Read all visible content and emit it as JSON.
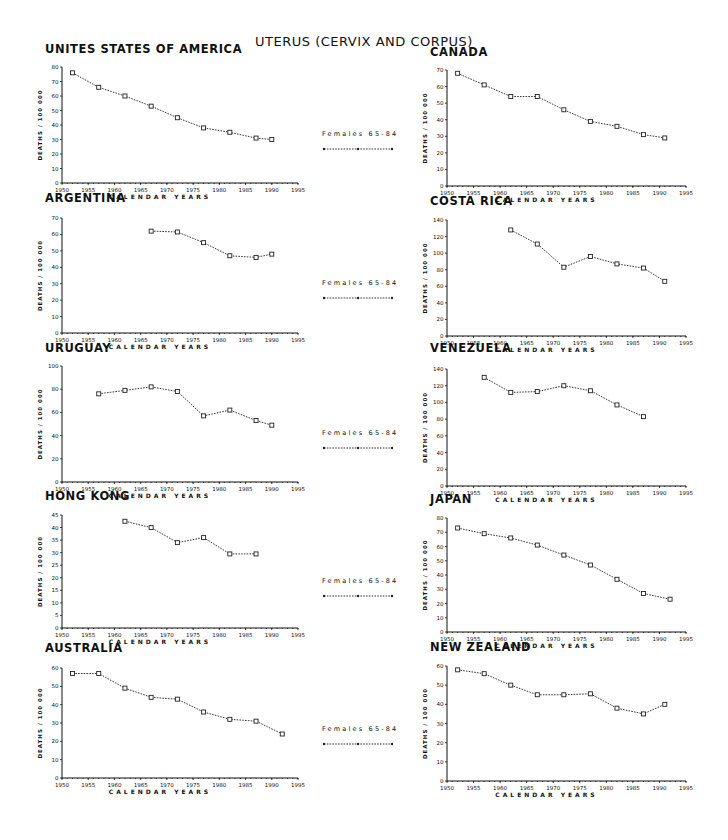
{
  "title": "UTERUS (CERVIX AND CORPUS)",
  "legend": {
    "label": "Females 65-84"
  },
  "axis": {
    "ylabel": "DEATHS / 100 000",
    "xlabel": "CALENDAR YEARS",
    "xticks": [
      "1950",
      "1955",
      "1960",
      "1965",
      "1970",
      "1975",
      "1980",
      "1985",
      "1990",
      "1995"
    ]
  },
  "chart_data": [
    {
      "type": "line",
      "title": "UNITES STATES OF AMERICA",
      "xlabel": "CALENDAR YEARS",
      "ylabel": "DEATHS / 100 000",
      "xlim": [
        1950,
        1995
      ],
      "ylim": [
        0,
        80
      ],
      "yticks": [
        0,
        10,
        20,
        30,
        40,
        50,
        60,
        70,
        80
      ],
      "series": [
        {
          "name": "Females 65-84",
          "x": [
            1952,
            1957,
            1962,
            1967,
            1972,
            1977,
            1982,
            1987,
            1990
          ],
          "values": [
            76,
            66,
            60,
            53,
            45,
            38,
            35,
            31,
            30
          ]
        }
      ],
      "layout": {
        "x0": 62,
        "x1": 298,
        "ytop": 67,
        "ybot": 183,
        "title_x": 45,
        "title_y": 52
      }
    },
    {
      "type": "line",
      "title": "CANADA",
      "xlabel": "CALENDAR YEARS",
      "ylabel": "DEATHS / 100 000",
      "xlim": [
        1950,
        1995
      ],
      "ylim": [
        0,
        70
      ],
      "yticks": [
        0,
        10,
        20,
        30,
        40,
        50,
        60,
        70
      ],
      "series": [
        {
          "name": "Females 65-84",
          "x": [
            1952,
            1957,
            1962,
            1967,
            1972,
            1977,
            1982,
            1987,
            1991
          ],
          "values": [
            68,
            61,
            54,
            54,
            46,
            39,
            36,
            31,
            29
          ]
        }
      ],
      "layout": {
        "x0": 447,
        "x1": 686,
        "ytop": 70,
        "ybot": 186,
        "title_x": 430,
        "title_y": 55
      }
    },
    {
      "type": "line",
      "title": "ARGENTINA",
      "xlabel": "CALENDAR YEARS",
      "ylabel": "DEATHS / 100 000",
      "xlim": [
        1950,
        1995
      ],
      "ylim": [
        0,
        70
      ],
      "yticks": [
        0,
        10,
        20,
        30,
        40,
        50,
        60,
        70
      ],
      "series": [
        {
          "name": "Females 65-84",
          "x": [
            1967,
            1972,
            1977,
            1982,
            1987,
            1990
          ],
          "values": [
            62,
            61.5,
            55,
            47,
            46,
            48
          ]
        }
      ],
      "layout": {
        "x0": 62,
        "x1": 298,
        "ytop": 218,
        "ybot": 333,
        "title_x": 45,
        "title_y": 201
      }
    },
    {
      "type": "line",
      "title": "COSTA RICA",
      "xlabel": "CALENDAR YEARS",
      "ylabel": "DEATHS / 100 000",
      "xlim": [
        1950,
        1995
      ],
      "ylim": [
        0,
        140
      ],
      "yticks": [
        0,
        20,
        40,
        60,
        80,
        100,
        120,
        140
      ],
      "series": [
        {
          "name": "Females 65-84",
          "x": [
            1962,
            1967,
            1972,
            1977,
            1982,
            1987,
            1991
          ],
          "values": [
            128,
            111,
            83,
            96,
            87,
            82,
            66
          ]
        }
      ],
      "layout": {
        "x0": 447,
        "x1": 686,
        "ytop": 220,
        "ybot": 336,
        "title_x": 430,
        "title_y": 204
      }
    },
    {
      "type": "line",
      "title": "URUGUAY",
      "xlabel": "CALENDAR YEARS",
      "ylabel": "DEATHS / 100 000",
      "xlim": [
        1950,
        1995
      ],
      "ylim": [
        0,
        100
      ],
      "yticks": [
        0,
        20,
        40,
        60,
        80,
        100
      ],
      "series": [
        {
          "name": "Females 65-84",
          "x": [
            1957,
            1962,
            1967,
            1972,
            1977,
            1982,
            1987,
            1990
          ],
          "values": [
            76,
            79,
            82,
            78,
            57,
            62,
            53,
            49
          ]
        }
      ],
      "layout": {
        "x0": 62,
        "x1": 298,
        "ytop": 366,
        "ybot": 482,
        "title_x": 45,
        "title_y": 351
      }
    },
    {
      "type": "line",
      "title": "VENEZUELA",
      "xlabel": "CALENDAR YEARS",
      "ylabel": "DEATHS / 100 000",
      "xlim": [
        1950,
        1995
      ],
      "ylim": [
        0,
        140
      ],
      "yticks": [
        0,
        20,
        40,
        60,
        80,
        100,
        120,
        140
      ],
      "series": [
        {
          "name": "Females 65-84",
          "x": [
            1957,
            1962,
            1967,
            1972,
            1977,
            1982,
            1987
          ],
          "values": [
            130,
            112,
            113,
            120,
            114,
            97,
            83
          ]
        }
      ],
      "layout": {
        "x0": 447,
        "x1": 686,
        "ytop": 369,
        "ybot": 486,
        "title_x": 430,
        "title_y": 351
      }
    },
    {
      "type": "line",
      "title": "HONG KONG",
      "xlabel": "CALENDAR YEARS",
      "ylabel": "DEATHS / 100 000",
      "xlim": [
        1950,
        1995
      ],
      "ylim": [
        0,
        45
      ],
      "yticks": [
        0,
        5,
        10,
        15,
        20,
        25,
        30,
        35,
        40,
        45
      ],
      "series": [
        {
          "name": "Females 65-84",
          "x": [
            1962,
            1967,
            1972,
            1977,
            1982,
            1987
          ],
          "values": [
            42.5,
            40,
            34,
            36,
            29.5,
            29.5
          ]
        }
      ],
      "layout": {
        "x0": 62,
        "x1": 298,
        "ytop": 515,
        "ybot": 628,
        "title_x": 45,
        "title_y": 499
      }
    },
    {
      "type": "line",
      "title": "JAPAN",
      "xlabel": "CALENDAR YEARS",
      "ylabel": "DEATHS / 100 000",
      "xlim": [
        1950,
        1995
      ],
      "ylim": [
        0,
        80
      ],
      "yticks": [
        0,
        10,
        20,
        30,
        40,
        50,
        60,
        70,
        80
      ],
      "series": [
        {
          "name": "Females 65-84",
          "x": [
            1952,
            1957,
            1962,
            1967,
            1972,
            1977,
            1982,
            1987,
            1992
          ],
          "values": [
            73,
            69,
            66,
            61,
            54,
            47,
            37,
            27,
            23
          ]
        }
      ],
      "layout": {
        "x0": 447,
        "x1": 686,
        "ytop": 518,
        "ybot": 632,
        "title_x": 430,
        "title_y": 502
      }
    },
    {
      "type": "line",
      "title": "AUSTRALIA",
      "xlabel": "CALENDAR YEARS",
      "ylabel": "DEATHS / 100 000",
      "xlim": [
        1950,
        1995
      ],
      "ylim": [
        0,
        60
      ],
      "yticks": [
        0,
        10,
        20,
        30,
        40,
        50,
        60
      ],
      "series": [
        {
          "name": "Females 65-84",
          "x": [
            1952,
            1957,
            1962,
            1967,
            1972,
            1977,
            1982,
            1987,
            1992
          ],
          "values": [
            57,
            57,
            49,
            44,
            43,
            36,
            32,
            31,
            24
          ]
        }
      ],
      "layout": {
        "x0": 62,
        "x1": 298,
        "ytop": 668,
        "ybot": 778,
        "title_x": 45,
        "title_y": 651
      }
    },
    {
      "type": "line",
      "title": "NEW ZEALAND",
      "xlabel": "CALENDAR YEARS",
      "ylabel": "DEATHS / 100 000",
      "xlim": [
        1950,
        1995
      ],
      "ylim": [
        0,
        60
      ],
      "yticks": [
        0,
        10,
        20,
        30,
        40,
        50,
        60
      ],
      "series": [
        {
          "name": "Females 65-84",
          "x": [
            1952,
            1957,
            1962,
            1967,
            1972,
            1977,
            1982,
            1987,
            1991
          ],
          "values": [
            58,
            56,
            50,
            45,
            45,
            45.5,
            38,
            35,
            40
          ]
        }
      ],
      "layout": {
        "x0": 447,
        "x1": 686,
        "ytop": 666,
        "ybot": 781,
        "title_x": 430,
        "title_y": 650
      }
    }
  ],
  "legends_layout": [
    {
      "left": 322,
      "top": 130
    },
    {
      "left": 322,
      "top": 279
    },
    {
      "left": 322,
      "top": 429
    },
    {
      "left": 322,
      "top": 577
    },
    {
      "left": 322,
      "top": 725
    }
  ]
}
